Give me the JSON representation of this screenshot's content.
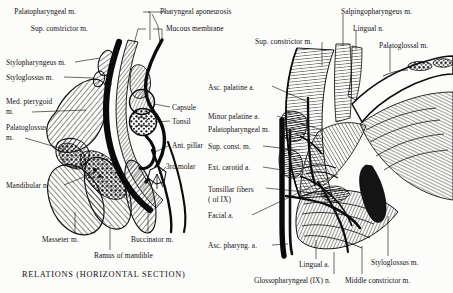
{
  "plate": {
    "caption_left": "RELATIONS (HORIZONTAL SECTION)"
  },
  "left_diagram": {
    "name": "horizontal-section-tonsil-relations",
    "labels": [
      {
        "id": "palatopharyngeal-m",
        "text": "Palatopharyngeal m.",
        "x": 76,
        "y": 8,
        "align": "right"
      },
      {
        "id": "pharyngeal-aponeurosis",
        "text": "Pharyngeal aponeurosis",
        "x": 160,
        "y": 8,
        "align": "left"
      },
      {
        "id": "sup-constrictor-m",
        "text": "Sup. constrictor m.",
        "x": 88,
        "y": 25,
        "align": "right"
      },
      {
        "id": "mucous-membrane",
        "text": "Mucous membrane",
        "x": 166,
        "y": 25,
        "align": "left"
      },
      {
        "id": "stylopharyngeus-m",
        "text": "Stylopharyngeus m.",
        "x": 6,
        "y": 59,
        "align": "left"
      },
      {
        "id": "styloglossus-m",
        "text": "Styloglossus m.",
        "x": 6,
        "y": 74,
        "align": "left"
      },
      {
        "id": "med-pterygoid-m-l1",
        "text": "Med. pterygoid",
        "x": 6,
        "y": 98,
        "align": "left"
      },
      {
        "id": "med-pterygoid-m-l2",
        "text": "m.",
        "x": 6,
        "y": 108,
        "align": "left"
      },
      {
        "id": "palatoglossus-m-l1",
        "text": "Palatoglossus",
        "x": 6,
        "y": 124,
        "align": "left"
      },
      {
        "id": "palatoglossus-m-l2",
        "text": "m.",
        "x": 6,
        "y": 134,
        "align": "left"
      },
      {
        "id": "capsule",
        "text": "Capsule",
        "x": 172,
        "y": 104,
        "align": "left"
      },
      {
        "id": "tonsil",
        "text": "Tonsil",
        "x": 172,
        "y": 118,
        "align": "left"
      },
      {
        "id": "ant-pillar",
        "text": "Ant. pillar",
        "x": 172,
        "y": 142,
        "align": "left"
      },
      {
        "id": "third-molar",
        "text": "3rd molar",
        "x": 166,
        "y": 163,
        "align": "left"
      },
      {
        "id": "mandibular-n",
        "text": "Mandibular n.",
        "x": 6,
        "y": 182,
        "align": "left"
      },
      {
        "id": "masseter-m",
        "text": "Masseter m.",
        "x": 42,
        "y": 236,
        "align": "left"
      },
      {
        "id": "buccinator-m",
        "text": "Buccinator m.",
        "x": 131,
        "y": 236,
        "align": "left"
      },
      {
        "id": "ramus-of-mandible",
        "text": "Ramus of mandible",
        "x": 94,
        "y": 252,
        "align": "left"
      }
    ]
  },
  "right_diagram": {
    "name": "lateral-dissection-tonsil-bed",
    "labels": [
      {
        "id": "sup-constrictor-m-r",
        "text": "Sup. constrictor m.",
        "x": 255,
        "y": 38,
        "align": "left"
      },
      {
        "id": "salpingopharyngeus-m",
        "text": "Salpingopharyngeus m.",
        "x": 341,
        "y": 8,
        "align": "left"
      },
      {
        "id": "lingual-n",
        "text": "Lingual n.",
        "x": 353,
        "y": 25,
        "align": "left"
      },
      {
        "id": "palatoglossal-m",
        "text": "Palatoglossal m.",
        "x": 379,
        "y": 42,
        "align": "left"
      },
      {
        "id": "asc-palatine-a",
        "text": "Asc. palatine a.",
        "x": 208,
        "y": 84,
        "align": "left"
      },
      {
        "id": "minor-palatine-a",
        "text": "Minor  palatine a.",
        "x": 208,
        "y": 113,
        "align": "left"
      },
      {
        "id": "palatopharyngeal-m-r",
        "text": "Palatopharyngeal m.",
        "x": 208,
        "y": 126,
        "align": "left"
      },
      {
        "id": "sup-const-m",
        "text": "Sup. const. m.",
        "x": 208,
        "y": 143,
        "align": "left"
      },
      {
        "id": "ext-carotid-a",
        "text": "Ext. carotid a.",
        "x": 208,
        "y": 164,
        "align": "left"
      },
      {
        "id": "tonsillar-fibers-l1",
        "text": "Tonsillar fibers",
        "x": 208,
        "y": 186,
        "align": "left"
      },
      {
        "id": "tonsillar-fibers-l2",
        "text": "( of IX)",
        "x": 208,
        "y": 196,
        "align": "left"
      },
      {
        "id": "facial-a",
        "text": "Facial a.",
        "x": 208,
        "y": 212,
        "align": "left"
      },
      {
        "id": "asc-pharyng-a",
        "text": "Asc. pharyng. a.",
        "x": 208,
        "y": 242,
        "align": "left"
      },
      {
        "id": "lingual-a",
        "text": "Lingual a.",
        "x": 299,
        "y": 261,
        "align": "left"
      },
      {
        "id": "styloglossus-m-r",
        "text": "Styloglossus m.",
        "x": 371,
        "y": 259,
        "align": "left"
      },
      {
        "id": "glossopharyngeal-ix-n",
        "text": "Glossopharyngeal (IX) n.",
        "x": 254,
        "y": 277,
        "align": "left"
      },
      {
        "id": "middle-constrictor-m",
        "text": "Middle constrictor m.",
        "x": 345,
        "y": 277,
        "align": "left"
      }
    ]
  }
}
